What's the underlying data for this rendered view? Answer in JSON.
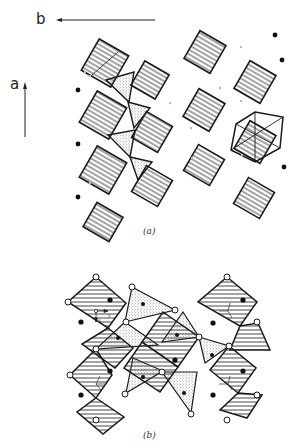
{
  "figure": {
    "panel_a": {
      "caption": "(a)",
      "axis_b_label": "b",
      "axis_a_label": "a",
      "description": "Chains of corner-linked square-hatched octahedra along a, linked by stippled triangles/tetrahedra, with isolated cations shown as black dots"
    },
    "panel_b": {
      "caption": "(b)",
      "local_axes": {
        "y_label": "y",
        "x_label": "x"
      },
      "description": "Rings of hatched octahedra and stippled triangles sharing corners; open circles mark shared oxygen vertices, filled circles mark cation sites"
    },
    "colors": {
      "line": "#1a1a1a",
      "hatch": "#333333",
      "stipple": "#555555",
      "background": "#ffffff",
      "open_atom_fill": "#ffffff"
    },
    "icons": {
      "filled_atom": "filled-circle",
      "open_atom": "open-circle",
      "axis_arrow": "arrow"
    }
  }
}
